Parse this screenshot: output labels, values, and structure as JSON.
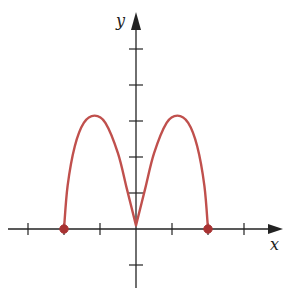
{
  "chart_data": {
    "type": "line",
    "title": "",
    "xlabel": "x",
    "ylabel": "y",
    "xlim": [
      -3,
      4
    ],
    "ylim": [
      -1,
      5
    ],
    "grid": false,
    "x_ticks": [
      -3,
      -2,
      -1,
      1,
      2,
      3
    ],
    "y_ticks": [
      -1,
      1,
      2,
      3,
      4,
      5
    ],
    "tick_labels_shown": false,
    "series": [
      {
        "name": "f(x)",
        "color": "#c0504d",
        "points": [
          {
            "x": -2.0,
            "y": 0.0
          },
          {
            "x": -1.9,
            "y": 1.2
          },
          {
            "x": -1.7,
            "y": 2.3
          },
          {
            "x": -1.45,
            "y": 2.95
          },
          {
            "x": -1.15,
            "y": 3.15
          },
          {
            "x": -0.85,
            "y": 2.95
          },
          {
            "x": -0.5,
            "y": 2.1
          },
          {
            "x": -0.25,
            "y": 1.1
          },
          {
            "x": 0.0,
            "y": 0.1
          },
          {
            "x": 0.25,
            "y": 1.1
          },
          {
            "x": 0.5,
            "y": 2.1
          },
          {
            "x": 0.85,
            "y": 2.95
          },
          {
            "x": 1.15,
            "y": 3.15
          },
          {
            "x": 1.45,
            "y": 2.95
          },
          {
            "x": 1.7,
            "y": 2.3
          },
          {
            "x": 1.9,
            "y": 1.2
          },
          {
            "x": 2.0,
            "y": 0.0
          }
        ],
        "endpoints": [
          {
            "x": -2,
            "y": 0,
            "closed": true
          },
          {
            "x": 2,
            "y": 0,
            "closed": true
          }
        ]
      }
    ]
  },
  "layout": {
    "origin_px": [
      136,
      229
    ],
    "unit_px": 36,
    "axis_color": "#222222",
    "dot_color": "#a83232"
  }
}
